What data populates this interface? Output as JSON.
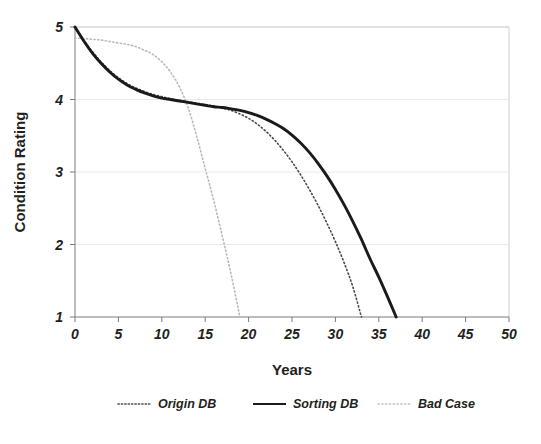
{
  "chart_data": {
    "type": "line",
    "title": "",
    "xlabel": "Years",
    "ylabel": "Condition Rating",
    "xlim": [
      0,
      50
    ],
    "ylim": [
      1,
      5
    ],
    "xticks": [
      "0",
      "5",
      "10",
      "15",
      "20",
      "25",
      "30",
      "35",
      "40",
      "45",
      "50"
    ],
    "yticks": [
      "1",
      "2",
      "3",
      "4",
      "5"
    ],
    "grid": "horizontal",
    "legend_position": "bottom",
    "colors": {
      "origin_db": "#4a4a4a",
      "sorting_db": "#1a1a1a",
      "bad_case": "#b9b9b9",
      "gridline": "#e9e9e9",
      "frame": "#cfcfcf",
      "text": "#231f20",
      "background": "#ffffff"
    },
    "series": [
      {
        "name": "Origin DB",
        "style": "dotted",
        "x": [
          0,
          1,
          2,
          3,
          4,
          5,
          6,
          7,
          8,
          9,
          10,
          11,
          12,
          13,
          14,
          15,
          16,
          17,
          18,
          19,
          20,
          21,
          22,
          23,
          24,
          25,
          26,
          27,
          28,
          29,
          30,
          31,
          32,
          33
        ],
        "values": [
          5.0,
          4.82,
          4.66,
          4.52,
          4.4,
          4.3,
          4.22,
          4.16,
          4.11,
          4.07,
          4.04,
          4.01,
          3.99,
          3.97,
          3.95,
          3.93,
          3.91,
          3.88,
          3.85,
          3.8,
          3.74,
          3.66,
          3.56,
          3.44,
          3.3,
          3.14,
          2.96,
          2.76,
          2.54,
          2.3,
          2.04,
          1.75,
          1.42,
          1.0
        ]
      },
      {
        "name": "Sorting DB",
        "style": "solid",
        "x": [
          0,
          1,
          2,
          3,
          4,
          5,
          6,
          7,
          8,
          9,
          10,
          11,
          12,
          13,
          14,
          15,
          16,
          17,
          18,
          19,
          20,
          21,
          22,
          23,
          24,
          25,
          26,
          27,
          28,
          29,
          30,
          31,
          32,
          33,
          34,
          35,
          36,
          37
        ],
        "values": [
          5.0,
          4.81,
          4.64,
          4.5,
          4.38,
          4.28,
          4.2,
          4.14,
          4.09,
          4.05,
          4.02,
          4.0,
          3.98,
          3.96,
          3.94,
          3.92,
          3.9,
          3.89,
          3.87,
          3.85,
          3.82,
          3.78,
          3.73,
          3.67,
          3.6,
          3.51,
          3.4,
          3.27,
          3.12,
          2.95,
          2.76,
          2.55,
          2.32,
          2.07,
          1.8,
          1.55,
          1.28,
          1.0
        ]
      },
      {
        "name": "Bad Case",
        "style": "dotted",
        "x": [
          0,
          1,
          2,
          3,
          4,
          5,
          6,
          7,
          8,
          9,
          10,
          11,
          12,
          13,
          14,
          15,
          16,
          17,
          18,
          19
        ],
        "values": [
          4.85,
          4.84,
          4.83,
          4.82,
          4.8,
          4.78,
          4.76,
          4.73,
          4.68,
          4.62,
          4.52,
          4.38,
          4.18,
          3.9,
          3.5,
          3.05,
          2.6,
          2.1,
          1.58,
          1.0
        ]
      }
    ],
    "legend": [
      {
        "label": "Origin DB",
        "style": "dotted",
        "color": "#4a4a4a"
      },
      {
        "label": "Sorting DB",
        "style": "solid",
        "color": "#1a1a1a"
      },
      {
        "label": "Bad Case",
        "style": "dotted",
        "color": "#b9b9b9"
      }
    ]
  }
}
